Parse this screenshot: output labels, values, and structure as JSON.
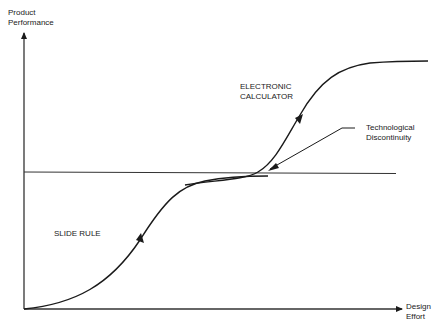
{
  "diagram": {
    "type": "s-curve",
    "axes": {
      "y_label_line1": "Product",
      "y_label_line2": "Performance",
      "x_label_line1": "Design",
      "x_label_line2": "Effort"
    },
    "curves": [
      {
        "name": "slide-rule",
        "label": "SLIDE RULE"
      },
      {
        "name": "electronic-calculator",
        "label_line1": "ELECTRONIC",
        "label_line2": "CALCULATOR"
      }
    ],
    "annotation": {
      "line1": "Technological",
      "line2": "Discontinuity"
    },
    "colors": {
      "stroke": "#1a1a1a",
      "background": "#ffffff"
    }
  }
}
